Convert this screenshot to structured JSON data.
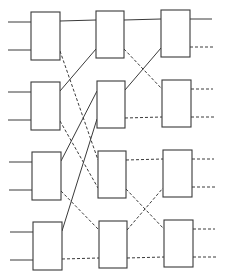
{
  "diagram": {
    "title": "",
    "type": "3-stage shuffle-exchange switching network",
    "colors": {
      "line": "#3a3a3a",
      "background": "#ffffff"
    },
    "stages": [
      {
        "name": "stage-1",
        "boxes": [
          {
            "x": 31,
            "y": 12,
            "w": 29,
            "h": 48
          },
          {
            "x": 31,
            "y": 82,
            "w": 29,
            "h": 48
          },
          {
            "x": 32,
            "y": 152,
            "w": 29,
            "h": 48
          },
          {
            "x": 33,
            "y": 222,
            "w": 29,
            "h": 48
          }
        ]
      },
      {
        "name": "stage-2",
        "boxes": [
          {
            "x": 96,
            "y": 11,
            "w": 28,
            "h": 47
          },
          {
            "x": 97,
            "y": 81,
            "w": 28,
            "h": 47
          },
          {
            "x": 98,
            "y": 151,
            "w": 28,
            "h": 47
          },
          {
            "x": 99,
            "y": 221,
            "w": 28,
            "h": 47
          }
        ]
      },
      {
        "name": "stage-3",
        "boxes": [
          {
            "x": 161,
            "y": 10,
            "w": 29,
            "h": 47
          },
          {
            "x": 162,
            "y": 80,
            "w": 29,
            "h": 47
          },
          {
            "x": 163,
            "y": 150,
            "w": 29,
            "h": 47
          },
          {
            "x": 164,
            "y": 220,
            "w": 29,
            "h": 47
          }
        ]
      }
    ],
    "wires": [
      {
        "name": "input-1",
        "x1": 8,
        "y1": 22,
        "x2": 31,
        "y2": 22,
        "style": "solid"
      },
      {
        "name": "input-2",
        "x1": 8,
        "y1": 50,
        "x2": 31,
        "y2": 50,
        "style": "solid"
      },
      {
        "name": "input-3",
        "x1": 8,
        "y1": 92,
        "x2": 31,
        "y2": 92,
        "style": "solid"
      },
      {
        "name": "input-4",
        "x1": 8,
        "y1": 120,
        "x2": 31,
        "y2": 120,
        "style": "solid"
      },
      {
        "name": "input-5",
        "x1": 9,
        "y1": 162,
        "x2": 32,
        "y2": 162,
        "style": "solid"
      },
      {
        "name": "input-6",
        "x1": 9,
        "y1": 190,
        "x2": 32,
        "y2": 190,
        "style": "solid"
      },
      {
        "name": "input-7",
        "x1": 10,
        "y1": 232,
        "x2": 33,
        "y2": 232,
        "style": "solid"
      },
      {
        "name": "input-8",
        "x1": 10,
        "y1": 260,
        "x2": 33,
        "y2": 260,
        "style": "solid"
      },
      {
        "name": "link-s1b1-s2b1",
        "x1": 60,
        "y1": 21,
        "x2": 96,
        "y2": 20,
        "style": "solid"
      },
      {
        "name": "link-s1b1-s2b3",
        "x1": 60,
        "y1": 51,
        "x2": 98,
        "y2": 160,
        "style": "dashed"
      },
      {
        "name": "link-s1b2-s2b1",
        "x1": 60,
        "y1": 91,
        "x2": 96,
        "y2": 49,
        "style": "solid"
      },
      {
        "name": "link-s1b2-s2b3",
        "x1": 60,
        "y1": 121,
        "x2": 98,
        "y2": 188,
        "style": "dashed"
      },
      {
        "name": "link-s1b3-s2b2",
        "x1": 61,
        "y1": 161,
        "x2": 97,
        "y2": 91,
        "style": "solid"
      },
      {
        "name": "link-s1b3-s2b4",
        "x1": 61,
        "y1": 191,
        "x2": 99,
        "y2": 230,
        "style": "dashed"
      },
      {
        "name": "link-s1b4-s2b2",
        "x1": 62,
        "y1": 231,
        "x2": 97,
        "y2": 119,
        "style": "solid"
      },
      {
        "name": "link-s1b4-s2b4",
        "x1": 62,
        "y1": 259,
        "x2": 99,
        "y2": 258,
        "style": "dashed"
      },
      {
        "name": "link-s2b1-s3b1",
        "x1": 124,
        "y1": 20,
        "x2": 161,
        "y2": 19,
        "style": "solid"
      },
      {
        "name": "link-s2b1-s3b2",
        "x1": 124,
        "y1": 49,
        "x2": 162,
        "y2": 89,
        "style": "dashed"
      },
      {
        "name": "link-s2b2-s3b1",
        "x1": 125,
        "y1": 90,
        "x2": 161,
        "y2": 48,
        "style": "solid"
      },
      {
        "name": "link-s2b2-s3b2",
        "x1": 125,
        "y1": 118,
        "x2": 162,
        "y2": 117,
        "style": "dashed"
      },
      {
        "name": "link-s2b3-s3b3",
        "x1": 126,
        "y1": 160,
        "x2": 163,
        "y2": 159,
        "style": "dashed"
      },
      {
        "name": "link-s2b3-s3b4",
        "x1": 126,
        "y1": 189,
        "x2": 164,
        "y2": 229,
        "style": "dashed"
      },
      {
        "name": "link-s2b4-s3b3",
        "x1": 127,
        "y1": 230,
        "x2": 163,
        "y2": 188,
        "style": "dashed"
      },
      {
        "name": "link-s2b4-s3b4",
        "x1": 127,
        "y1": 258,
        "x2": 164,
        "y2": 257,
        "style": "dashed"
      },
      {
        "name": "output-1",
        "x1": 190,
        "y1": 19,
        "x2": 212,
        "y2": 19,
        "style": "solid"
      },
      {
        "name": "output-2",
        "x1": 190,
        "y1": 47,
        "x2": 213,
        "y2": 47,
        "style": "dashed"
      },
      {
        "name": "output-3",
        "x1": 191,
        "y1": 89,
        "x2": 213,
        "y2": 89,
        "style": "dashed"
      },
      {
        "name": "output-4",
        "x1": 191,
        "y1": 117,
        "x2": 214,
        "y2": 117,
        "style": "dashed"
      },
      {
        "name": "output-5",
        "x1": 192,
        "y1": 159,
        "x2": 214,
        "y2": 159,
        "style": "dashed"
      },
      {
        "name": "output-6",
        "x1": 192,
        "y1": 187,
        "x2": 215,
        "y2": 187,
        "style": "dashed"
      },
      {
        "name": "output-7",
        "x1": 193,
        "y1": 229,
        "x2": 215,
        "y2": 229,
        "style": "dashed"
      },
      {
        "name": "output-8",
        "x1": 193,
        "y1": 257,
        "x2": 216,
        "y2": 257,
        "style": "dashed"
      }
    ]
  }
}
